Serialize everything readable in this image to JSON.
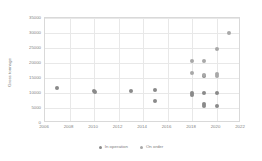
{
  "chart_data": {
    "type": "scatter",
    "title": "",
    "xlabel": "",
    "ylabel": "Gross tonnage",
    "xlim": [
      2006,
      2022
    ],
    "ylim": [
      0,
      35000
    ],
    "grid": true,
    "legend_position": "bottom",
    "x_ticks": [
      2006,
      2008,
      2010,
      2012,
      2014,
      2016,
      2018,
      2020,
      2022
    ],
    "y_ticks": [
      0,
      5000,
      10000,
      15000,
      20000,
      25000,
      30000,
      35000
    ],
    "x_tick_labels": [
      "2006",
      "2008",
      "2010",
      "2012",
      "2014",
      "2016",
      "2018",
      "2020",
      "2022"
    ],
    "y_tick_labels": [
      "0",
      "5000",
      "10000",
      "15000",
      "20000",
      "25000",
      "30000",
      "35000"
    ],
    "series": [
      {
        "name": "In operation",
        "color": "#8a8a8a",
        "points": [
          {
            "x": 2007.0,
            "y": 11600
          },
          {
            "x": 2010.0,
            "y": 10700
          },
          {
            "x": 2010.1,
            "y": 10500
          },
          {
            "x": 2013.0,
            "y": 10800
          },
          {
            "x": 2015.0,
            "y": 11100
          },
          {
            "x": 2015.0,
            "y": 7400
          },
          {
            "x": 2018.0,
            "y": 9900
          },
          {
            "x": 2018.0,
            "y": 9400
          },
          {
            "x": 2019.0,
            "y": 9900
          },
          {
            "x": 2019.0,
            "y": 6200
          },
          {
            "x": 2019.0,
            "y": 5700
          },
          {
            "x": 2019.0,
            "y": 15700
          },
          {
            "x": 2020.0,
            "y": 10100
          },
          {
            "x": 2020.0,
            "y": 5800
          }
        ]
      },
      {
        "name": "On order",
        "color": "#a8a8a8",
        "points": [
          {
            "x": 2018.0,
            "y": 20700
          },
          {
            "x": 2018.0,
            "y": 16800
          },
          {
            "x": 2019.0,
            "y": 20700
          },
          {
            "x": 2019.0,
            "y": 15900
          },
          {
            "x": 2020.0,
            "y": 16300
          },
          {
            "x": 2020.0,
            "y": 15700
          },
          {
            "x": 2020.0,
            "y": 24800
          },
          {
            "x": 2021.0,
            "y": 30000
          }
        ]
      }
    ]
  },
  "legend": {
    "items": [
      {
        "label": "In operation",
        "color": "#8a8a8a"
      },
      {
        "label": "On order",
        "color": "#a8a8a8"
      }
    ]
  }
}
